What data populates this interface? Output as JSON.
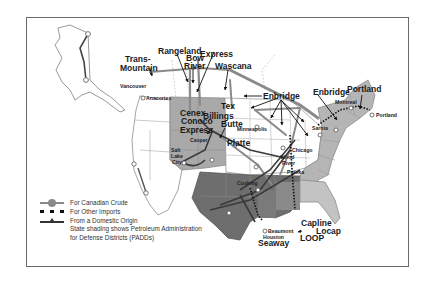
{
  "map": {
    "subject": "Crude oil pipelines into the United States",
    "pipeline_labels": {
      "trans_mountain": [
        "Trans-",
        "Mountain"
      ],
      "rangeland": "Rangeland",
      "bow_river": [
        "Bow",
        "River"
      ],
      "express": "Express",
      "wascana": "Wascana",
      "enbridge_main": "Enbridge",
      "enbridge_east": "Enbridge",
      "portland": "Portland",
      "cenex": "Cenex",
      "conoco": "Conoco",
      "express_south": "Express",
      "butte": "Butte",
      "platte": "Platte",
      "tex": "Tex",
      "capline": "Capline",
      "locap": "Locap",
      "loop": "LOOP",
      "seaway": "Seaway"
    },
    "city_labels": {
      "vancouver": "Vancouver",
      "anacortes": "Anacortes",
      "billings": "Billings",
      "casper": "Casper",
      "salt_lake_city": [
        "Salt",
        "Lake",
        "City"
      ],
      "minneapolis": "Minneapolis",
      "chicago": "Chicago",
      "sarnia": "Sarnia",
      "montreal": "Montreal",
      "portland_me": "Portland",
      "wood_river": [
        "Wood",
        "River"
      ],
      "patoka": "Patoka",
      "cushing": "Cushing",
      "beaumont": "Beaumont",
      "houston": "Houston"
    },
    "colors": {
      "canadian_crude": "#8a8a8a",
      "other_imports": "#111111",
      "domestic": "#3a3a3a",
      "padd1": "#b5b5b5",
      "padd2": "#ffffff",
      "padd3": "#6e6e6e",
      "padd4": "#a9a9a9",
      "padd5": "#ffffff",
      "state_border": "#9a9a9a"
    }
  },
  "legend": {
    "items": [
      {
        "symbol": "canadian",
        "label": "For Canadian Crude"
      },
      {
        "symbol": "imports",
        "label": "For Other Imports"
      },
      {
        "symbol": "domestic",
        "label": "From a Domestic Origin"
      }
    ],
    "note_line1": "State shading shows Petroleum Administration",
    "note_line2": "for Defense Districts (PADDs)"
  }
}
